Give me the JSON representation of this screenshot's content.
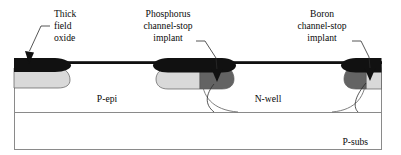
{
  "figure": {
    "type": "semiconductor-cross-section",
    "background_color": "#ffffff",
    "frame_color": "#8a8a8a"
  },
  "callouts": [
    {
      "id": "thick-field-oxide",
      "lines": [
        "Thick",
        "field",
        "oxide"
      ],
      "align": "start",
      "text_x": 54,
      "text_y_start": 16,
      "line_height": 12,
      "leader": "M 50 26 L 41 26 L 29 50 L 32 58",
      "arrow": "M 29 63 L 25.5 54 L 34 54 Z",
      "arrow_color": "#111111"
    },
    {
      "id": "phosphorus-channel-stop-implant",
      "lines": [
        "Phosphorus",
        "channel-stop",
        "implant"
      ],
      "align": "middle",
      "text_x": 168,
      "text_y_start": 16,
      "line_height": 12,
      "leader": "M 196 41 L 204 41 L 214 56 L 216 72",
      "arrow": "M 216 82 L 211 70 L 221 70 Z",
      "arrow_color": "#111111"
    },
    {
      "id": "boron-channel-stop-implant",
      "lines": [
        "Boron",
        "channel-stop",
        "implant"
      ],
      "align": "middle",
      "text_x": 322,
      "text_y_start": 16,
      "line_height": 12,
      "leader": "M 352 41 L 360 41 L 368 56 L 369 70",
      "arrow": "M 369 81 L 364 69 L 374 69 Z",
      "arrow_color": "#111111"
    }
  ],
  "region_labels": [
    {
      "id": "p-epi",
      "text": "P-epi",
      "x": 107,
      "y": 100,
      "anchor": "middle"
    },
    {
      "id": "n-well",
      "text": "N-well",
      "x": 268,
      "y": 100,
      "anchor": "middle"
    },
    {
      "id": "p-subs",
      "text": "P-subs",
      "x": 368,
      "y": 143,
      "anchor": "end"
    }
  ],
  "frame": {
    "outer": {
      "x": 14,
      "y": 62,
      "width": 368,
      "height": 88
    },
    "epi_subs_divider_y": 112,
    "top_surface_y": 62
  },
  "layers": {
    "oxide_color": "#111111",
    "light_implant_color": "#d9d9d9",
    "dark_implant_color": "#636363",
    "substrate_color": "#ffffff"
  },
  "oxide_islands": [
    {
      "id": "left-field-oxide",
      "x": 14,
      "width": 56,
      "has_light_implant": true,
      "has_dark_implant": false
    },
    {
      "id": "middle-field-oxide",
      "x": 155,
      "width": 78,
      "has_light_implant": true,
      "has_dark_implant": true
    },
    {
      "id": "right-field-oxide",
      "x": 344,
      "width": 38,
      "has_light_implant": false,
      "has_dark_implant": true
    }
  ],
  "gate_oxide": {
    "id": "thin-gate-oxide",
    "color": "#111111",
    "thickness": 2.6
  },
  "n_well": {
    "left_arc_start_x": 200,
    "left_arc_bottom_x": 236,
    "right_arc_bottom_x": 336,
    "right_arc_end_x": 366,
    "bottom_y": 112
  }
}
